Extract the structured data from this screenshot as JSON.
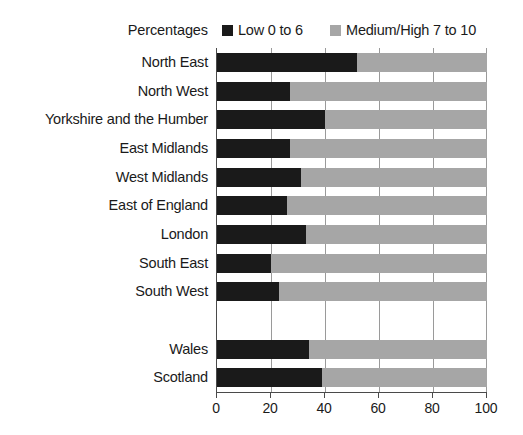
{
  "chart": {
    "axis_title": "Percentages",
    "xlabel": "",
    "ylabel": ""
  },
  "legend": {
    "position": "top",
    "items": [
      {
        "label": "Low 0 to 6",
        "color": "#1a1a1a",
        "swatch_name": "legend-swatch-low"
      },
      {
        "label": "Medium/High 7 to 10",
        "color": "#a6a6a6",
        "swatch_name": "legend-swatch-medium-high"
      }
    ]
  },
  "xaxis": {
    "ticks": [
      "0",
      "20",
      "40",
      "60",
      "80",
      "100"
    ],
    "min": 0,
    "max": 100
  },
  "chart_data": {
    "type": "bar",
    "orientation": "horizontal",
    "stacked": true,
    "title": "",
    "xlabel": "Percentages",
    "ylabel": "",
    "xlim": [
      0,
      100
    ],
    "grid": true,
    "legend_position": "top",
    "categories": [
      "North East",
      "North West",
      "Yorkshire and the Humber",
      "East Midlands",
      "West Midlands",
      "East of England",
      "London",
      "South East",
      "South West",
      "",
      "Wales",
      "Scotland"
    ],
    "series": [
      {
        "name": "Low 0 to 6",
        "color": "#1a1a1a",
        "values": [
          52,
          27,
          40,
          27,
          31,
          26,
          33,
          20,
          23,
          null,
          34,
          39
        ]
      },
      {
        "name": "Medium/High 7 to 10",
        "color": "#a6a6a6",
        "values": [
          48,
          73,
          60,
          73,
          69,
          74,
          67,
          80,
          77,
          null,
          66,
          61
        ]
      }
    ]
  }
}
